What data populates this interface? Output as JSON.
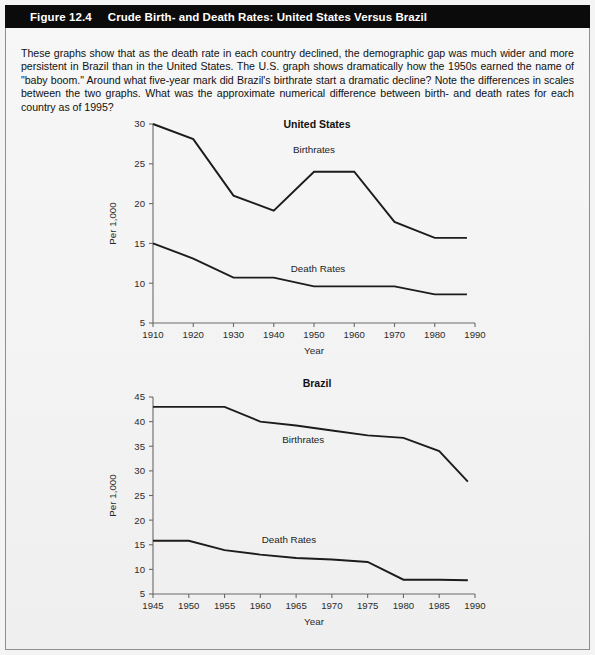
{
  "figure": {
    "number": "Figure 12.4",
    "title": "Crude Birth- and Death Rates: United States Versus Brazil",
    "caption_bar_color": "#0b0b0b",
    "caption_text_color": "#ffffff",
    "page_background": "#f4f4f4",
    "border_color": "#8e8e8e"
  },
  "intro": {
    "text": "These graphs show that as the death rate in each country declined, the demographic gap was much wider and more persistent in Brazil than in the United States. The U.S. graph shows dramatically how the 1950s earned the name of \"baby boom.\" Around what five-year mark did Brazil's birthrate start a dramatic decline? Note the differences in scales between the two graphs. What was the approximate numerical difference between birth- and death rates for each country as of 1995?"
  },
  "chart_data": [
    {
      "id": "united-states",
      "type": "line",
      "title": "United States",
      "xlabel": "Year",
      "ylabel": "Per 1,000",
      "x": [
        1910,
        1920,
        1930,
        1940,
        1950,
        1960,
        1970,
        1980,
        1988
      ],
      "xticks": [
        1910,
        1920,
        1930,
        1940,
        1950,
        1960,
        1970,
        1980,
        1990
      ],
      "xticklabels": [
        "1910",
        "1920",
        "1930",
        "1940",
        "1950",
        "1960",
        "1970",
        "1980",
        "1990"
      ],
      "yticks": [
        5,
        10,
        15,
        20,
        25,
        30
      ],
      "yticklabels": [
        "5",
        "10",
        "15",
        "20",
        "25",
        "30"
      ],
      "xlim": [
        1910,
        1990
      ],
      "ylim": [
        5,
        30
      ],
      "grid": false,
      "legend_position": "inline-annotations",
      "series": [
        {
          "name": "Birthrates",
          "label_x": 1950,
          "label_y": 26.3,
          "values": [
            30.0,
            28.1,
            21.0,
            19.1,
            24.0,
            24.0,
            17.7,
            15.7,
            15.7
          ]
        },
        {
          "name": "Death Rates",
          "label_x": 1951,
          "label_y": 11.4,
          "values": [
            15.0,
            13.1,
            10.7,
            10.7,
            9.6,
            9.6,
            9.6,
            8.6,
            8.6
          ]
        }
      ]
    },
    {
      "id": "brazil",
      "type": "line",
      "title": "Brazil",
      "xlabel": "Year",
      "ylabel": "Per 1,000",
      "x": [
        1945,
        1950,
        1955,
        1960,
        1965,
        1970,
        1975,
        1980,
        1985,
        1989
      ],
      "xticks": [
        1945,
        1950,
        1955,
        1960,
        1965,
        1970,
        1975,
        1980,
        1985,
        1990
      ],
      "xticklabels": [
        "1945",
        "1950",
        "1955",
        "1960",
        "1965",
        "1970",
        "1975",
        "1980",
        "1985",
        "1990"
      ],
      "yticks": [
        5,
        10,
        15,
        20,
        25,
        30,
        35,
        40,
        45
      ],
      "yticklabels": [
        "5",
        "10",
        "15",
        "20",
        "25",
        "30",
        "35",
        "40",
        "45"
      ],
      "xlim": [
        1945,
        1990
      ],
      "ylim": [
        5,
        45
      ],
      "grid": false,
      "legend_position": "inline-annotations",
      "series": [
        {
          "name": "Birthrates",
          "label_x": 1966,
          "label_y": 35.6,
          "values": [
            43.0,
            43.0,
            43.0,
            40.0,
            39.2,
            38.2,
            37.2,
            36.7,
            34.0,
            27.8
          ]
        },
        {
          "name": "Death Rates",
          "label_x": 1964,
          "label_y": 15.3,
          "values": [
            15.8,
            15.8,
            13.9,
            13.0,
            12.3,
            12.0,
            11.5,
            7.9,
            7.9,
            7.8
          ]
        }
      ]
    }
  ]
}
